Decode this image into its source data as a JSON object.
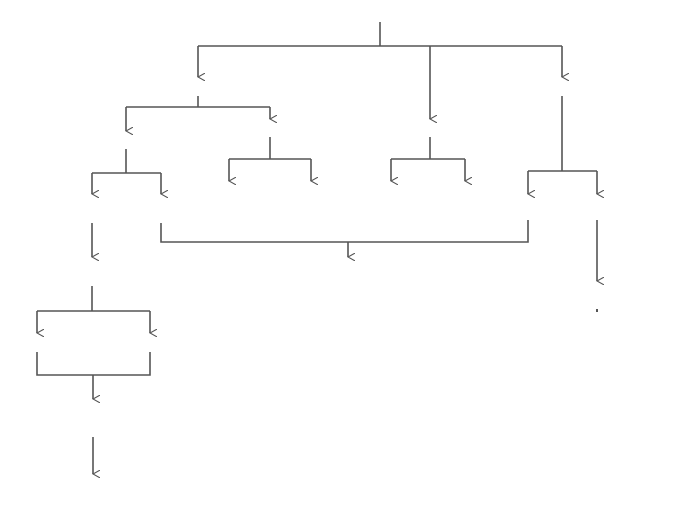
{
  "diagram": {
    "caption": "(e)",
    "line_color": "#555555",
    "nodes": {
      "arch": {
        "label": "Arch of aorta",
        "x": 343,
        "y": 8
      },
      "brachiocephalic": {
        "label": "Brachiocephalic",
        "x": 198,
        "y": 81
      },
      "left_subclavian": {
        "label": "Left subclavian",
        "x": 568,
        "y": 81
      },
      "right_subclavian": {
        "label": "Right subclavian",
        "x": 126,
        "y": 136
      },
      "right_common_carotid": {
        "label": "Right common carotid",
        "x": 270,
        "y": 124
      },
      "left_common_carotid": {
        "label": "Left common carotid",
        "x": 430,
        "y": 124
      },
      "right_external_carotid": {
        "label": "Right external\ncarotid",
        "x": 229,
        "y": 186
      },
      "right_internal_carotid": {
        "label": "Right  internal\ncarotid",
        "x": 311,
        "y": 186
      },
      "left_internal_carotid": {
        "label": "Left internal\ncarotid",
        "x": 391,
        "y": 186
      },
      "left_external_carotid": {
        "label": "Left external\ncarotid",
        "x": 465,
        "y": 186
      },
      "right_axillary": {
        "label": "Right\naxillary",
        "x": 92,
        "y": 199
      },
      "right_vertebral": {
        "label": "Right\nvertebral",
        "x": 161,
        "y": 199
      },
      "left_vertebral": {
        "label": "Left\nvertebral",
        "x": 528,
        "y": 199
      },
      "left_axillary": {
        "label": "Left\naxillary",
        "x": 597,
        "y": 199
      },
      "basilar": {
        "label": "Basilar",
        "x": 348,
        "y": 262
      },
      "right_brachial": {
        "label": "Right\nbrachial",
        "x": 92,
        "y": 262
      },
      "left_brachial": {
        "label": "Left\nbrachial",
        "x": 597,
        "y": 286
      },
      "right_radial": {
        "label": "Right radial",
        "x": 37,
        "y": 338
      },
      "right_ulnar": {
        "label": "Right ulnar",
        "x": 150,
        "y": 338
      },
      "left_ulnar": {
        "label": "Left ulnar",
        "x": 541,
        "y": 338
      },
      "left_radial": {
        "label": "Left radial",
        "x": 655,
        "y": 338
      },
      "right_palmar": {
        "label": "Right superficial\nand deep palmar\narches",
        "x": 93,
        "y": 404
      },
      "left_palmar": {
        "label": "Left superficial\nand deep palmar\narches",
        "x": 597,
        "y": 404
      },
      "right_digitals": {
        "label": "Right digitals",
        "x": 93,
        "y": 479
      },
      "left_digitals": {
        "label": "Left digitals",
        "x": 597,
        "y": 476
      }
    }
  }
}
